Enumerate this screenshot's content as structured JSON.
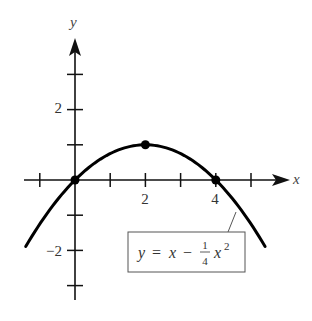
{
  "chart_data": {
    "type": "line",
    "title": "",
    "xlabel": "x",
    "ylabel": "y",
    "function": "y = x - (1/4)x^2",
    "equation_label": {
      "lhs": "y",
      "eq": "=",
      "x": "x",
      "minus": "−",
      "frac_num": "1",
      "frac_den": "4",
      "x2": "x",
      "exp": "2"
    },
    "xlim": [
      -1.4,
      5.4
    ],
    "ylim": [
      -3.2,
      4.0
    ],
    "x_ticks": [
      -1,
      0,
      1,
      2,
      3,
      4,
      5
    ],
    "y_ticks": [
      -3,
      -2,
      -1,
      1,
      2,
      3
    ],
    "x_tick_labels": [
      {
        "value": 2,
        "label": "2"
      },
      {
        "value": 4,
        "label": "4"
      }
    ],
    "y_tick_labels": [
      {
        "value": 2,
        "label": "2"
      },
      {
        "value": -2,
        "label": "−2"
      }
    ],
    "marked_points": [
      {
        "x": 0,
        "y": 0
      },
      {
        "x": 2,
        "y": 1
      },
      {
        "x": 4,
        "y": 0
      }
    ],
    "curve_domain": [
      -1.4,
      5.4
    ],
    "grid": false,
    "legend": "none",
    "colors": {
      "curve": "#000000",
      "axes": "#111111",
      "box_border": "#555555"
    }
  }
}
